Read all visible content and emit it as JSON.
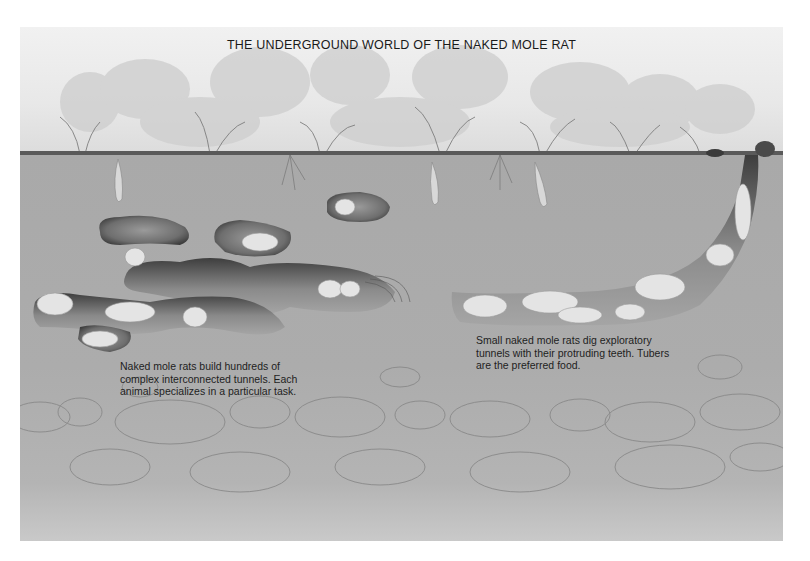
{
  "title": "THE UNDERGROUND WORLD OF THE NAKED MOLE RAT",
  "captions": {
    "colony": "Naked mole rats build hundreds of complex interconnected tunnels. Each animal specializes in a particular task.",
    "exploratory": "Small naked mole rats dig exploratory tunnels with their protruding teeth. Tubers are the preferred food."
  },
  "scene": {
    "layers": [
      "surface vegetation",
      "soil",
      "stone layer"
    ],
    "elements": [
      "interconnected tunnel system",
      "isolated tunnel chambers",
      "nest chamber",
      "tubers",
      "exploratory tunnel to surface",
      "surface mound"
    ],
    "colors": {
      "sky": "#ececec",
      "soil": "#aaaaaa",
      "tunnel": "#5f5f5f",
      "mole_rat": "#e6e6e6",
      "text": "#1a1a1a"
    }
  }
}
